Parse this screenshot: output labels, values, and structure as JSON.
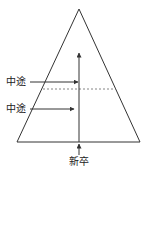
{
  "diagram": {
    "type": "pyramid-hiring-flow",
    "labels": {
      "midcareer_upper": "中途",
      "midcareer_lower": "中途",
      "new_graduate": "新卒"
    },
    "colors": {
      "line": "#333333",
      "dashed": "#666666",
      "background": "#ffffff"
    }
  }
}
